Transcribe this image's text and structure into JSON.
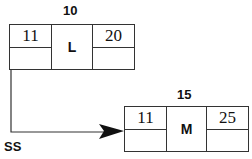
{
  "diagram": {
    "nodes": [
      {
        "id": "L",
        "header": "10",
        "center": "L",
        "left_value": "11",
        "right_value": "20"
      },
      {
        "id": "M",
        "header": "15",
        "center": "M",
        "left_value": "11",
        "right_value": "25"
      }
    ],
    "edges": [
      {
        "from": "L",
        "to": "M",
        "label": "SS"
      }
    ]
  },
  "colors": {
    "line": "#333333",
    "text": "#111111",
    "background": "#ffffff"
  }
}
